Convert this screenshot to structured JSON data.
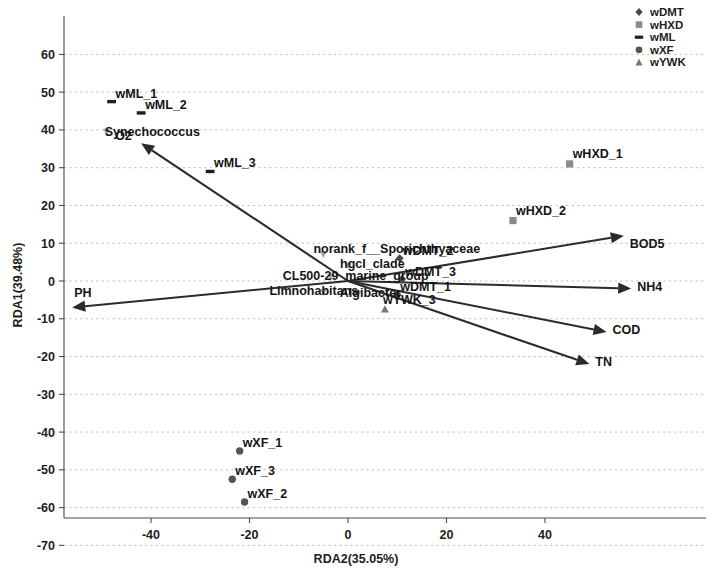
{
  "figure": {
    "type": "rda-ordination-scatter",
    "background": "#ffffff"
  },
  "axes": {
    "x": {
      "title": "RDA2(35.05%)",
      "ticks": [
        "-40",
        "-20",
        "0",
        "20",
        "40"
      ],
      "tick_values": [
        -40,
        -20,
        0,
        20,
        40
      ],
      "range": [
        -58,
        60
      ]
    },
    "y": {
      "title": "RDA1(39.48%)",
      "ticks": [
        "60",
        "50",
        "40",
        "30",
        "20",
        "10",
        "0",
        "-10",
        "-20",
        "-30",
        "-40",
        "-50",
        "-60",
        "-70"
      ],
      "tick_values": [
        60,
        50,
        40,
        30,
        20,
        10,
        0,
        -10,
        -20,
        -30,
        -40,
        -50,
        -60,
        -70
      ],
      "range": [
        -70,
        60
      ]
    }
  },
  "legend": {
    "position": "top-right",
    "items": [
      {
        "label": "wDMT",
        "marker": "diamond",
        "color": "#4a4a4a"
      },
      {
        "label": "wHXD",
        "marker": "square",
        "color": "#8a8a8a"
      },
      {
        "label": "wML",
        "marker": "dash",
        "color": "#1f1f1f"
      },
      {
        "label": "wXF",
        "marker": "circle",
        "color": "#555555"
      },
      {
        "label": "wYWK",
        "marker": "triangle",
        "color": "#777777"
      }
    ]
  },
  "chart_data": {
    "type": "scatter",
    "title": "",
    "xlabel": "RDA2(35.05%)",
    "ylabel": "RDA1(39.48%)",
    "xlim": [
      -58,
      60
    ],
    "ylim": [
      -70,
      60
    ],
    "grid": true,
    "legend_position": "top-right",
    "samples": [
      {
        "name": "wML_1",
        "group": "wML",
        "marker": "dash",
        "x": -48.0,
        "y": 47.5,
        "label_dx": 4,
        "label_dy": -4
      },
      {
        "name": "wML_2",
        "group": "wML",
        "marker": "dash",
        "x": -42.0,
        "y": 44.5,
        "label_dx": 4,
        "label_dy": -4
      },
      {
        "name": "wML_3",
        "group": "wML",
        "marker": "dash",
        "x": -28.0,
        "y": 29.0,
        "label_dx": 4,
        "label_dy": -4
      },
      {
        "name": "wHXD_1",
        "group": "wHXD",
        "marker": "square",
        "x": 45.0,
        "y": 31.0,
        "label_dx": 3,
        "label_dy": -6
      },
      {
        "name": "wHXD_2",
        "group": "wHXD",
        "marker": "square",
        "x": 33.5,
        "y": 16.0,
        "label_dx": 3,
        "label_dy": -6
      },
      {
        "name": "wDMT_2",
        "group": "wDMT",
        "marker": "diamond",
        "x": 10.5,
        "y": 6.0,
        "label_dx": 3,
        "label_dy": -3
      },
      {
        "name": "wDMT_3",
        "group": "wDMT",
        "marker": "diamond",
        "x": 11.0,
        "y": 0.5,
        "label_dx": 3,
        "label_dy": -3
      },
      {
        "name": "wDMT_1",
        "group": "wDMT",
        "marker": "diamond",
        "x": 10.0,
        "y": -3.5,
        "label_dx": 3,
        "label_dy": -3
      },
      {
        "name": "wYWK_3",
        "group": "wYWK",
        "marker": "triangle",
        "x": 7.5,
        "y": -7.5,
        "label_dx": -2,
        "label_dy": -5
      },
      {
        "name": "wXF_1",
        "group": "wXF",
        "marker": "circle",
        "x": -22.0,
        "y": -45.0,
        "label_dx": 3,
        "label_dy": -4
      },
      {
        "name": "wXF_3",
        "group": "wXF",
        "marker": "circle",
        "x": -23.5,
        "y": -52.5,
        "label_dx": 3,
        "label_dy": -4
      },
      {
        "name": "wXF_2",
        "group": "wXF",
        "marker": "circle",
        "x": -21.0,
        "y": -58.5,
        "label_dx": 3,
        "label_dy": -4
      }
    ],
    "species": [
      {
        "name": "Synechococcus",
        "x": -49.0,
        "y": 39.5,
        "label_anchor": "start",
        "label_dx": -2,
        "label_dy": 4
      },
      {
        "name": "norank_f__Sporichthyaceae",
        "x": -5.0,
        "y": 7.0,
        "label_anchor": "start",
        "label_dx": -10,
        "label_dy": -2
      },
      {
        "name": "hgcI_clade",
        "x": 0.0,
        "y": 4.0,
        "label_anchor": "start",
        "label_dx": -8,
        "label_dy": 2
      },
      {
        "name": "CL500-29_marine_group",
        "x": -3.5,
        "y": 1.0,
        "label_anchor": "start",
        "label_dx": -48,
        "label_dy": 3
      },
      {
        "name": "Limnohabitans",
        "x": -5.0,
        "y": -3.0,
        "label_anchor": "start",
        "label_dx": -54,
        "label_dy": 3
      },
      {
        "name": "Algibacter",
        "x": 2.0,
        "y": -3.5,
        "label_anchor": "start",
        "label_dx": -18,
        "label_dy": 3
      }
    ],
    "env_vectors": [
      {
        "name": "O2",
        "tip_x": -42.0,
        "tip_y": 36.5,
        "label_dx": -26,
        "label_dy": -3
      },
      {
        "name": "PH",
        "tip_x": -56.0,
        "tip_y": -7.0,
        "label_dx": 2,
        "label_dy": -10
      },
      {
        "name": "BOD5",
        "tip_x": 56.0,
        "tip_y": 12.0,
        "label_dx": 6,
        "label_dy": 12
      },
      {
        "name": "NH4",
        "tip_x": 57.5,
        "tip_y": -2.0,
        "label_dx": 6,
        "label_dy": 2
      },
      {
        "name": "COD",
        "tip_x": 52.5,
        "tip_y": -13.5,
        "label_dx": 6,
        "label_dy": 2
      },
      {
        "name": "TN",
        "tip_x": 49.0,
        "tip_y": -22.0,
        "label_dx": 6,
        "label_dy": 2
      }
    ]
  }
}
